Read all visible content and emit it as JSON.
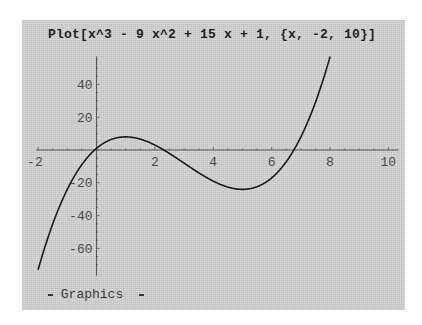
{
  "notebook": {
    "input": "Plot[x^3 - 9 x^2 + 15 x + 1, {x, -2, 10}]",
    "output_label": "Graphics"
  },
  "chart_data": {
    "type": "line",
    "title": "",
    "function": "x^3 - 9 x^2 + 15 x + 1",
    "xlabel": "",
    "ylabel": "",
    "xlim": [
      -2,
      10
    ],
    "ylim": [
      -73,
      57
    ],
    "x_ticks": [
      -2,
      2,
      4,
      6,
      8,
      10
    ],
    "y_ticks": [
      40,
      20,
      -20,
      -40,
      -60
    ],
    "grid": false,
    "legend": null,
    "series": [
      {
        "name": "x^3 - 9x^2 + 15x + 1",
        "x": [
          -2,
          -1.5,
          -1,
          -0.5,
          0,
          0.5,
          1,
          1.5,
          2,
          2.5,
          3,
          3.5,
          4,
          4.5,
          5,
          5.5,
          6,
          6.5,
          7,
          7.5,
          8
        ],
        "y": [
          -73,
          -47.9,
          -24,
          -9.1,
          1,
          6.4,
          8,
          6.6,
          3,
          -1.9,
          -8,
          -14.1,
          -19,
          -23.1,
          -24,
          -23.6,
          -17,
          -4.9,
          8,
          26.6,
          57
        ],
        "color": "#1a1a1a"
      }
    ],
    "critical_points": {
      "local_max": [
        1,
        8
      ],
      "local_min": [
        5,
        -24
      ]
    }
  }
}
